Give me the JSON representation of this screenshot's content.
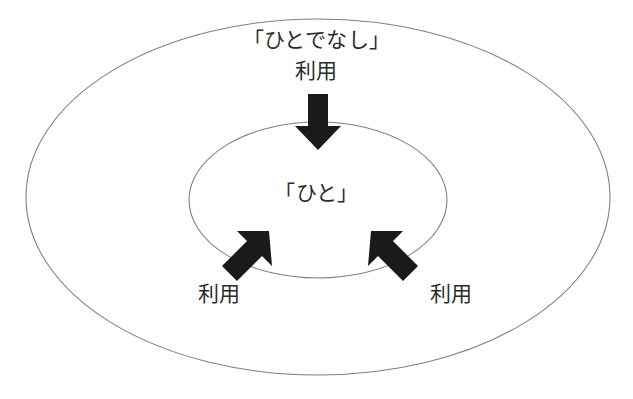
{
  "diagram": {
    "title_visible": false,
    "background_color": "#ffffff",
    "outline_color": "#808080",
    "arrow_color": "#1a1a1a",
    "text_color": "#2b2b2b",
    "outer_region": {
      "name": "outer-ellipse",
      "label": "「ひとでなし」",
      "center_x": 318,
      "center_y": 197,
      "radius_x": 292,
      "radius_y": 178
    },
    "inner_region": {
      "name": "inner-ellipse",
      "label": "「ひと」",
      "center_x": 318,
      "center_y": 200,
      "radius_x": 129,
      "radius_y": 78
    },
    "arrows": [
      {
        "id": "top-arrow",
        "label": "利用",
        "direction": "down",
        "from_x": 318,
        "from_y": 95,
        "to_x": 318,
        "to_y": 148
      },
      {
        "id": "left-arrow",
        "label": "利用",
        "direction": "up-right",
        "from_x": 224,
        "from_y": 277,
        "to_x": 270,
        "to_y": 233
      },
      {
        "id": "right-arrow",
        "label": "利用",
        "direction": "up-left",
        "from_x": 416,
        "from_y": 277,
        "to_x": 370,
        "to_y": 233
      }
    ]
  },
  "labels": {
    "outer_title": "「ひとでなし」",
    "outer_use": "利用",
    "inner_title": "「ひと」",
    "use_left": "利用",
    "use_right": "利用"
  }
}
